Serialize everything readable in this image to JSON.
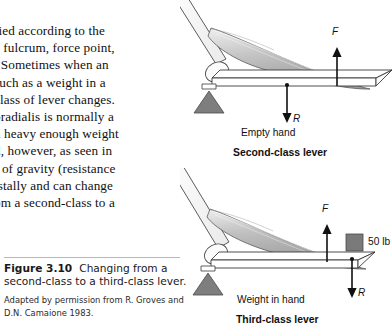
{
  "body_text": {
    "lines": [
      "fied  according  to  the",
      "e fulcrum, force point,",
      ". Sometimes  when  an",
      "such  as  a  weight  in  a",
      "class  of  lever  changes.",
      "oradialis  is  normally  a",
      "n heavy enough weight",
      "d,  however,  as  seen  in",
      "r of gravity (resistance",
      "istally  and  can  change",
      "om a second-class to a"
    ]
  },
  "caption": {
    "figure_number": "Figure 3.10",
    "figure_title": "Changing from a second-class to a third-class lever.",
    "credit": "Adapted by permission from R. Groves and D.N. Camaione 1983."
  },
  "diagrams": {
    "top": {
      "force_label": "F",
      "resistance_label": "R",
      "condition_label": "Empty hand",
      "title": "Second-class lever"
    },
    "bottom": {
      "force_label": "F",
      "resistance_label": "R",
      "weight_label": "50 lb",
      "condition_label": "Weight in hand",
      "title": "Third-class lever"
    }
  },
  "colors": {
    "ink": "#111111",
    "muscle_fill": "#b8b8b8",
    "muscle_fill_light": "#d8d8d8",
    "fulcrum_fill": "#7e7e7e",
    "weight_fill": "#7a7a7a",
    "bone_fill": "#fdfdfd",
    "rule": "#b9b9b9"
  }
}
